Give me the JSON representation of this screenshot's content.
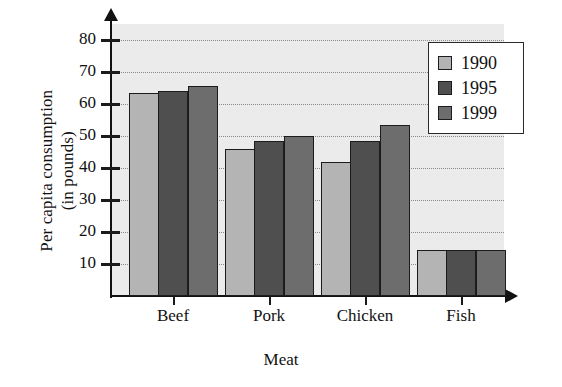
{
  "chart_data": {
    "type": "bar",
    "title": "",
    "xlabel": "Meat",
    "ylabel": "Per capita consumption (in pounds)",
    "ylabel_line1": "Per capita consumption",
    "ylabel_line2": "(in pounds)",
    "categories": [
      "Beef",
      "Pork",
      "Chicken",
      "Fish"
    ],
    "series": [
      {
        "name": "1990",
        "values": [
          63.5,
          46.0,
          42.0,
          14.5
        ],
        "color": "#b4b4b4"
      },
      {
        "name": "1995",
        "values": [
          64.0,
          48.5,
          48.5,
          14.5
        ],
        "color": "#4f4f4f"
      },
      {
        "name": "1999",
        "values": [
          65.5,
          50.0,
          53.5,
          14.5
        ],
        "color": "#6d6d6d"
      }
    ],
    "ylim": [
      0,
      85
    ],
    "yticks": [
      10,
      20,
      30,
      40,
      50,
      60,
      70,
      80
    ],
    "ytick_labels": [
      "10",
      "20",
      "30",
      "40",
      "50",
      "60",
      "70",
      "80"
    ],
    "grid": true,
    "grid_orientation": "horizontal",
    "legend_position": "top-right",
    "legend_entries": [
      "1990",
      "1995",
      "1999"
    ],
    "plot_background": "#ebebeb",
    "axis_color": "#121212"
  }
}
